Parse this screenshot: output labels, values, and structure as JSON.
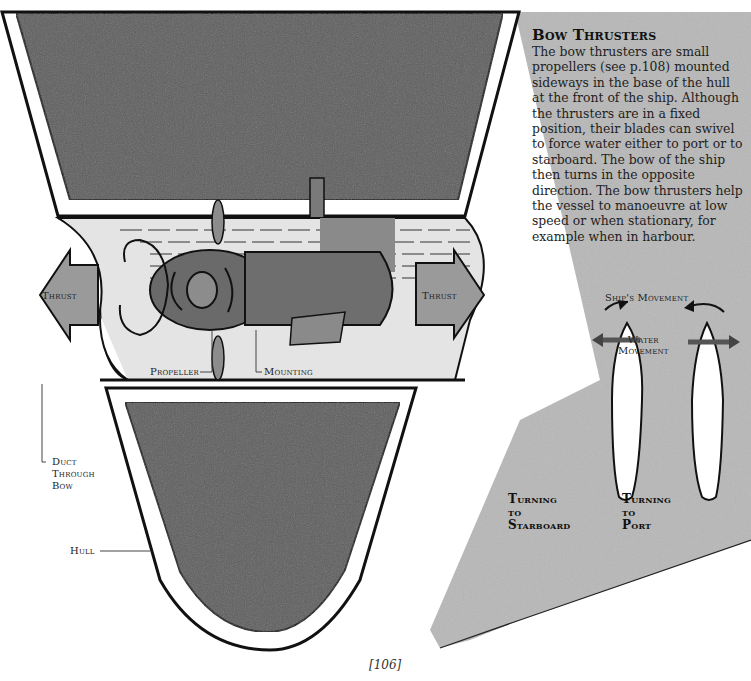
{
  "article": {
    "heading": "Bow Thrusters",
    "body": "The bow thrusters are small propellers (see p.108) mounted sideways in the base of the hull at the front of the ship. Although the thrusters are in a fixed position, their blades can swivel to force water either to port or to starboard. The bow of the ship then turns in the opposite direction. The bow thrusters help the vessel to manoeuvre at low speed or when stationary, for example when in harbour."
  },
  "labels": {
    "thrust_left": "Thrust",
    "thrust_right": "Thrust",
    "propeller": "Propeller",
    "mounting": "Mounting",
    "duct_line1": "Duct",
    "duct_line2": "Through",
    "duct_line3": "Bow",
    "hull": "Hull",
    "ships_movement": "Ship's Movement",
    "water_line1": "Water",
    "water_line2": "Movement",
    "starboard_line1": "Turning",
    "starboard_line2": "to",
    "starboard_line3": "Starboard",
    "port_line1": "Turning",
    "port_line2": "to",
    "port_line3": "Port"
  },
  "page": {
    "number": "[106]"
  },
  "colors": {
    "hull_dark": "#5f5f5f",
    "hull_side": "#b4b4b4",
    "thrust_arrow": "#9a9a9a",
    "duct_light": "#e6e6e6",
    "outline": "#111111"
  }
}
